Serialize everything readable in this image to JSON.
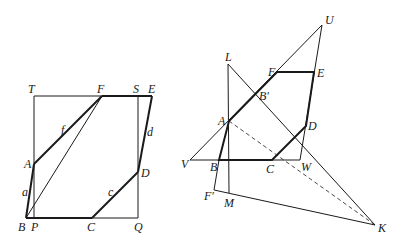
{
  "left_figure": {
    "points": {
      "T": {
        "label": "T",
        "x": 34,
        "y": 96
      },
      "F": {
        "label": "F",
        "x": 102,
        "y": 96
      },
      "S": {
        "label": "S",
        "x": 138,
        "y": 96
      },
      "E": {
        "label": "E",
        "x": 152,
        "y": 96
      },
      "A": {
        "label": "A",
        "x": 34,
        "y": 164
      },
      "D": {
        "label": "D",
        "x": 138,
        "y": 172
      },
      "B": {
        "label": "B",
        "x": 26,
        "y": 218
      },
      "P": {
        "label": "P",
        "x": 34,
        "y": 218
      },
      "C": {
        "label": "C",
        "x": 92,
        "y": 218
      },
      "Q": {
        "label": "Q",
        "x": 138,
        "y": 218
      }
    },
    "side_labels": {
      "f": "f",
      "a": "a",
      "d": "d",
      "c": "c"
    }
  },
  "right_figure": {
    "points": {
      "U": {
        "label": "U",
        "x": 322,
        "y": 25
      },
      "L": {
        "label": "L",
        "x": 228,
        "y": 64
      },
      "F": {
        "label": "F",
        "x": 277,
        "y": 72
      },
      "E": {
        "label": "E",
        "x": 314,
        "y": 72
      },
      "B_prime": {
        "label": "B′",
        "x": 256,
        "y": 95
      },
      "A": {
        "label": "A",
        "x": 229,
        "y": 121
      },
      "D": {
        "label": "D",
        "x": 306,
        "y": 126
      },
      "V": {
        "label": "V",
        "x": 190,
        "y": 160
      },
      "B": {
        "label": "B",
        "x": 219,
        "y": 160
      },
      "C": {
        "label": "C",
        "x": 272,
        "y": 160
      },
      "W": {
        "label": "W",
        "x": 300,
        "y": 160
      },
      "F_prime": {
        "label": "F′",
        "x": 214,
        "y": 190
      },
      "M": {
        "label": "M",
        "x": 229,
        "y": 193
      },
      "K": {
        "label": "K",
        "x": 375,
        "y": 225
      }
    }
  }
}
